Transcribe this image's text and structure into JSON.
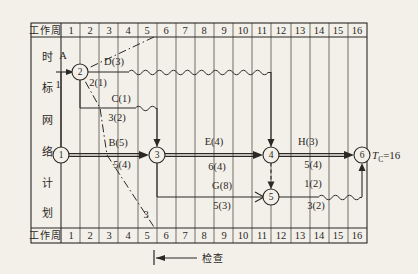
{
  "figure": {
    "row_label": "工作周",
    "weeks": [
      "1",
      "2",
      "3",
      "4",
      "5",
      "6",
      "7",
      "8",
      "9",
      "10",
      "11",
      "12",
      "13",
      "14",
      "15",
      "16"
    ],
    "side_title": [
      "时",
      "标",
      "网",
      "络",
      "计",
      "划"
    ],
    "nodes": [
      "1",
      "2",
      "3",
      "4",
      "5",
      "6"
    ],
    "labels": {
      "a_name": "A",
      "a_dur": "1",
      "d_name": "D(3)",
      "d_sub": "2(1)",
      "c_name": "C(1)",
      "c_sub": "3(2)",
      "b_name": "B(5)",
      "b_sub": "5(4)",
      "e_name": "E(4)",
      "e_sub": "6(4)",
      "g_name": "G(8)",
      "g_sub": "5(3)",
      "h_name": "H(3)",
      "h_sub": "5(4)",
      "i_name": "1(2)",
      "i_sub": "3(2)",
      "front_line_mark": "3",
      "check": "检查",
      "tc_t": "T",
      "tc_sub": "C",
      "tc_val": "=16"
    },
    "colors": {
      "ink": "#2b2824",
      "paper": "#f3f0ea"
    }
  }
}
